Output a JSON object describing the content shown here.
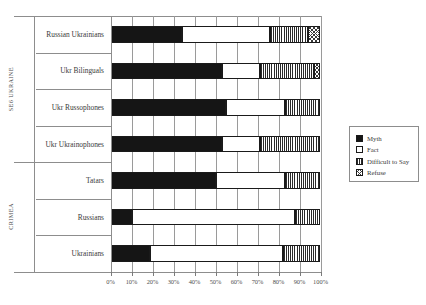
{
  "chart_data": {
    "type": "bar",
    "orientation": "horizontal",
    "stacked": true,
    "stacked_mode": "percent",
    "title": "",
    "subtitle": "",
    "xlabel": "",
    "ylabel": "",
    "xlim": [
      0,
      100
    ],
    "xtick_labels": [
      "0%",
      "10%",
      "20%",
      "30%",
      "40%",
      "50%",
      "60%",
      "70%",
      "80%",
      "90%",
      "100%"
    ],
    "xticks": [
      0,
      10,
      20,
      30,
      40,
      50,
      60,
      70,
      80,
      90,
      100
    ],
    "grid": true,
    "grid_axis": "x",
    "legend_position": "right",
    "legend": [
      "Myth",
      "Fact",
      "Difficult to Say",
      "Refuse"
    ],
    "series": [
      {
        "name": "Myth",
        "fill": "solid-black",
        "values": [
          34,
          53,
          55,
          53,
          50,
          10,
          19
        ]
      },
      {
        "name": "Fact",
        "fill": "white",
        "values": [
          42,
          18,
          28,
          18,
          33,
          78,
          63
        ]
      },
      {
        "name": "Difficult to Say",
        "fill": "vertical-lines",
        "values": [
          18,
          26,
          17,
          29,
          17,
          12,
          18
        ]
      },
      {
        "name": "Refuse",
        "fill": "cross-hatch",
        "values": [
          6,
          3,
          0,
          0,
          0,
          0,
          0
        ]
      }
    ],
    "categories": [
      "Russian Ukrainians",
      "Ukr Bilinguals",
      "Ukr Russophones",
      "Ukr Ukrainophones",
      "Tatars",
      "Russians",
      "Ukrainians"
    ],
    "category_groups": [
      {
        "label": "SE6 UKRAINE",
        "categories": [
          "Russian Ukrainians",
          "Ukr Bilinguals",
          "Ukr Russophones",
          "Ukr Ukrainophones"
        ]
      },
      {
        "label": "CRIMEA",
        "categories": [
          "Tatars",
          "Russians",
          "Ukrainians"
        ]
      }
    ]
  },
  "legend": {
    "items": [
      {
        "label": "Myth",
        "swatch": "solid-black-swatch"
      },
      {
        "label": "Fact",
        "swatch": "white-swatch"
      },
      {
        "label": "Difficult to Say",
        "swatch": "vertical-lines-swatch"
      },
      {
        "label": "Refuse",
        "swatch": "cross-hatch-swatch"
      }
    ]
  }
}
